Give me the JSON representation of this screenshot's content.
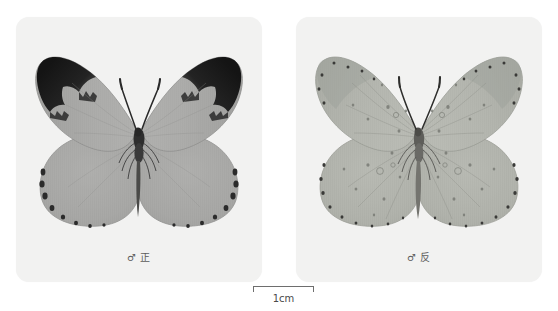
{
  "page": {
    "background_color": "#ffffff",
    "width": 558,
    "height": 311,
    "kind": "butterfly-specimen-plate"
  },
  "panels": [
    {
      "id": "dorsal",
      "caption": "♂ 正",
      "background_color": "#f2f2f1",
      "specimen": {
        "view": "dorsal",
        "sex_symbol": "♂",
        "wing_color": "#a9a9a7",
        "wing_edge_color": "#8d8d8b",
        "apex_patch_color": "#1d1d1d",
        "body_color": "#3a3a3a",
        "has_black_apex": true,
        "marginal_dots": true,
        "speckles": false
      }
    },
    {
      "id": "ventral",
      "caption": "♂ 反",
      "background_color": "#f2f2f1",
      "specimen": {
        "view": "ventral",
        "sex_symbol": "♂",
        "wing_color": "#b2b4ad",
        "wing_edge_color": "#96988f",
        "apex_patch_color": "#9aa09a",
        "body_color": "#4a4a4a",
        "has_black_apex": false,
        "marginal_dots": true,
        "speckles": true
      }
    }
  ],
  "scale_bar": {
    "label": "1cm",
    "line_color": "#6e6e6e",
    "length_px": 61
  }
}
